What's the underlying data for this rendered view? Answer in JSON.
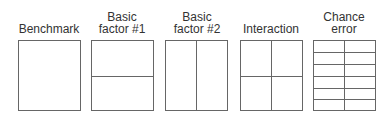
{
  "diagram": {
    "panels": [
      {
        "label": "Benchmark",
        "divisions": {
          "rows": 1,
          "cols": 1
        }
      },
      {
        "label_line1": "Basic",
        "label_line2": "factor #1",
        "divisions": {
          "rows": 2,
          "cols": 1
        }
      },
      {
        "label_line1": "Basic",
        "label_line2": "factor #2",
        "divisions": {
          "rows": 1,
          "cols": 2
        }
      },
      {
        "label": "Interaction",
        "divisions": {
          "rows": 2,
          "cols": 2
        }
      },
      {
        "label_line1": "Chance",
        "label_line2": "error",
        "divisions": {
          "rows": 6,
          "cols": 2
        }
      }
    ],
    "colors": {
      "line": "#666666",
      "text": "#333333",
      "background": "#ffffff"
    }
  }
}
